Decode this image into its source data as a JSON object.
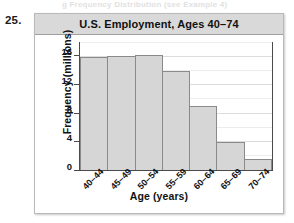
{
  "page": {
    "top_partial_text": "g         Frequency Distribution  (see Example 4)",
    "exercise_number": "25."
  },
  "chart_data": {
    "type": "bar",
    "title": "U.S. Employment, Ages 40–74",
    "xlabel": "Age (years)",
    "ylabel": "Frequency (millions)",
    "categories": [
      "40–44",
      "45–49",
      "50–54",
      "55–59",
      "60–64",
      "65–69",
      "70–74"
    ],
    "values": [
      16.0,
      16.2,
      16.3,
      14.0,
      9.1,
      4.0,
      1.5
    ],
    "ylim": [
      0,
      18
    ],
    "yticks": [
      0,
      4,
      8,
      12,
      16
    ],
    "ytick_labels": [
      "0",
      "4",
      "8",
      "12",
      "16"
    ],
    "grid": true,
    "legend": "none",
    "bar_fill": "#d6d6d6",
    "bar_stroke": "#8a8a8a",
    "title_bar_color": "#d9d9d9",
    "axis_color": "#4a4a4a"
  }
}
